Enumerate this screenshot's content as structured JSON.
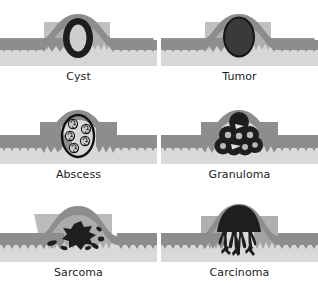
{
  "figure": {
    "rows": 3,
    "columns": 2,
    "background_color": "#ffffff",
    "label_color": "#1b1b1b"
  },
  "palette": {
    "epithelium_dark": "#8d8d8d",
    "epithelium_edge": "#7c7c7c",
    "submucosa_light": "#d3d3d3",
    "submucosa_lighter": "#dcdcdc",
    "lesion_dark": "#1e1e1e",
    "lesion_mid": "#3b3b3b",
    "cyst_lumen": "#cfcfcf",
    "cell_fill": "#c9c9c9",
    "outline": "#111111"
  },
  "panels": [
    {
      "id": "cyst",
      "label": "Cyst",
      "lesion_type": "thick-ring-oval",
      "description": "Thick dark ring enclosing a pale fluid-filled lumen within a raised mucosal dome",
      "position": {
        "row": 1,
        "column": 1
      },
      "lesion_color": "#1e1e1e",
      "lumen_color": "#cfcfcf"
    },
    {
      "id": "tumor",
      "label": "Tumor",
      "lesion_type": "solid-oval",
      "description": "Solid dark oval mass filling the raised dome with a thin darker rim",
      "position": {
        "row": 1,
        "column": 2
      },
      "lesion_color": "#333333",
      "rim_color": "#141414"
    },
    {
      "id": "abscess",
      "label": "Abscess",
      "lesion_type": "outlined-oval-with-cells",
      "description": "Thin dark oval outline containing five small round inflammatory cells with lobed nuclei",
      "position": {
        "row": 2,
        "column": 1
      },
      "outline_color": "#111111",
      "cell_count": 5,
      "cell_fill": "#c9c9c9"
    },
    {
      "id": "granuloma",
      "label": "Granuloma",
      "lesion_type": "cell-cluster",
      "description": "Compact cluster of about ten dark epithelioid cells with pale nuclei plus two wedge-shaped giant cells",
      "position": {
        "row": 2,
        "column": 2
      },
      "cell_count": 10,
      "cell_color": "#1e1e1e",
      "nucleus_color": "#b9b9b9"
    },
    {
      "id": "sarcoma",
      "label": "Sarcoma",
      "lesion_type": "irregular-blob-with-satellites",
      "description": "Irregular star-shaped dark mass with six scattered satellite fragments in the submucosa",
      "position": {
        "row": 3,
        "column": 1
      },
      "lesion_color": "#1e1e1e",
      "satellite_count": 6
    },
    {
      "id": "carcinoma",
      "label": "Carcinoma",
      "lesion_type": "dome-with-invasive-roots",
      "description": "Dark dome-shaped surface mass with branching finger-like projections invading downward through the tissue layers",
      "position": {
        "row": 3,
        "column": 2
      },
      "lesion_color": "#1e1e1e"
    }
  ]
}
